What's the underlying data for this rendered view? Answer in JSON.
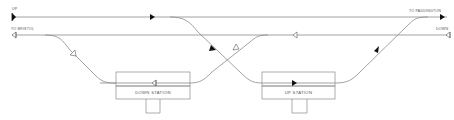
{
  "diagram": {
    "type": "railway track layout",
    "colors": {
      "line": "#8a8a8a",
      "arrow": "#111111",
      "text": "#555555",
      "background": "#ffffff"
    },
    "labels": {
      "up": "UP",
      "to_bristol": "TO BRISTOL",
      "to_paddington": "TO PADDINGTON",
      "down": "DOWN"
    },
    "stations": [
      {
        "name": "DOWN STATION",
        "direction_arrow": "hollow-left"
      },
      {
        "name": "UP STATION",
        "direction_arrow": "filled-right"
      }
    ],
    "tracks": [
      {
        "name": "up-main-line",
        "arrows": [
          "filled-right",
          "filled-right",
          "filled-right"
        ]
      },
      {
        "name": "down-main-line",
        "arrows": [
          "hollow-left",
          "hollow-left",
          "hollow-left"
        ]
      },
      {
        "name": "down-loop-to-down-station",
        "arrows": [
          "hollow-left"
        ]
      },
      {
        "name": "crossover-up-to-up-station",
        "arrows": [
          "filled-right"
        ]
      },
      {
        "name": "crossover-down-station-to-down-main",
        "arrows": [
          "hollow-left"
        ]
      },
      {
        "name": "up-station-to-up-main",
        "arrows": [
          "filled-right"
        ]
      }
    ]
  }
}
